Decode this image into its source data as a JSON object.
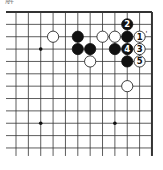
{
  "title": "解",
  "board": {
    "cols": 12,
    "rows": 12,
    "x0": 16,
    "y0": 12,
    "spacing": 12.36,
    "edges": [
      "top",
      "right"
    ]
  },
  "star_points": [
    [
      2,
      3
    ],
    [
      2,
      9
    ],
    [
      8,
      9
    ]
  ],
  "stones": [
    {
      "color": "black",
      "col": 9,
      "row": 1,
      "label": "2"
    },
    {
      "color": "white",
      "col": 3,
      "row": 2,
      "label": ""
    },
    {
      "color": "black",
      "col": 5,
      "row": 2,
      "label": ""
    },
    {
      "color": "white",
      "col": 7,
      "row": 2,
      "label": ""
    },
    {
      "color": "white",
      "col": 8,
      "row": 2,
      "label": ""
    },
    {
      "color": "black",
      "col": 9,
      "row": 2,
      "label": ""
    },
    {
      "color": "white",
      "col": 10,
      "row": 2,
      "label": "1"
    },
    {
      "color": "black",
      "col": 5,
      "row": 3,
      "label": ""
    },
    {
      "color": "black",
      "col": 6,
      "row": 3,
      "label": ""
    },
    {
      "color": "black",
      "col": 8,
      "row": 3,
      "label": ""
    },
    {
      "color": "black",
      "col": 9,
      "row": 3,
      "label": "4"
    },
    {
      "color": "white",
      "col": 10,
      "row": 3,
      "label": "3"
    },
    {
      "color": "white",
      "col": 6,
      "row": 4,
      "label": ""
    },
    {
      "color": "black",
      "col": 9,
      "row": 4,
      "label": ""
    },
    {
      "color": "white",
      "col": 10,
      "row": 4,
      "label": "5"
    },
    {
      "color": "white",
      "col": 9,
      "row": 6,
      "label": ""
    }
  ],
  "annotations": [
    {
      "col": 10,
      "row": 2,
      "text": "'"
    }
  ]
}
